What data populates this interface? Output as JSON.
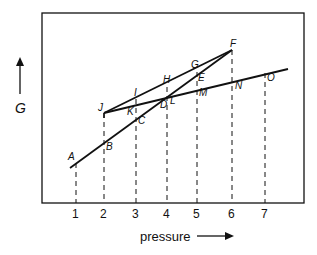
{
  "diagram": {
    "y_axis_label": "G",
    "x_axis_label": "pressure",
    "x_ticks": [
      "1",
      "2",
      "3",
      "4",
      "5",
      "6",
      "7"
    ],
    "point_labels": {
      "A": "A",
      "B": "B",
      "C": "C",
      "D": "D",
      "E": "E",
      "F": "F",
      "G": "G",
      "H": "H",
      "I": "I",
      "J": "J",
      "K": "K",
      "L": "L",
      "M": "M",
      "N": "N",
      "O": "O"
    },
    "lines": [
      {
        "name": "A-B-C-D-E-F",
        "points": [
          "A",
          "B",
          "C",
          "D",
          "E",
          "F"
        ]
      },
      {
        "name": "J-I-H-G-F",
        "points": [
          "J",
          "I",
          "H",
          "G",
          "F"
        ]
      },
      {
        "name": "J-K-L-M-N-O",
        "points": [
          "J",
          "K",
          "L",
          "M",
          "N",
          "O"
        ]
      }
    ],
    "colors": {
      "ink": "#111111",
      "background": "#ffffff"
    }
  }
}
